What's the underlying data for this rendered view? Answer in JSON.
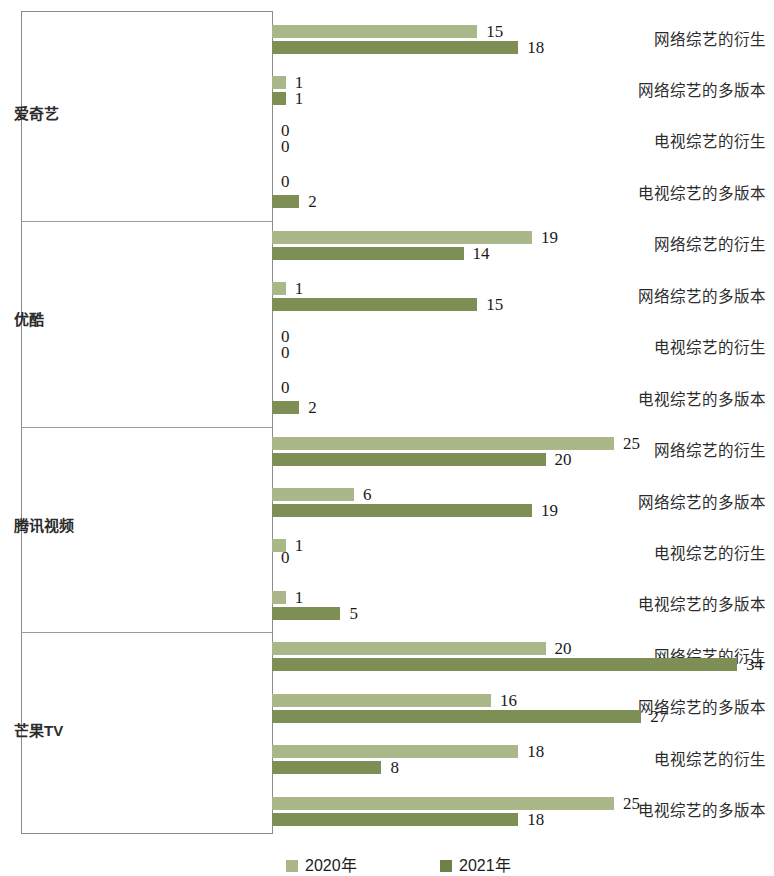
{
  "chart_data": {
    "type": "bar",
    "orientation": "horizontal",
    "title": "",
    "xlabel": "",
    "ylabel": "",
    "xlim": [
      0,
      34
    ],
    "grid": false,
    "legend_position": "bottom",
    "series": [
      {
        "name": "2020年",
        "color": "#a9b789"
      },
      {
        "name": "2021年",
        "color": "#7d8f54"
      }
    ],
    "groups": [
      {
        "name": "爱奇艺",
        "categories": [
          "网络综艺的衍生",
          "网络综艺的多版本",
          "电视综艺的衍生",
          "电视综艺的多版本"
        ],
        "values_2020": [
          15,
          1,
          0,
          0
        ],
        "values_2021": [
          18,
          1,
          0,
          2
        ]
      },
      {
        "name": "优酷",
        "categories": [
          "网络综艺的衍生",
          "网络综艺的多版本",
          "电视综艺的衍生",
          "电视综艺的多版本"
        ],
        "values_2020": [
          19,
          1,
          0,
          0
        ],
        "values_2021": [
          14,
          15,
          0,
          2
        ]
      },
      {
        "name": "腾讯视频",
        "categories": [
          "网络综艺的衍生",
          "网络综艺的多版本",
          "电视综艺的衍生",
          "电视综艺的多版本"
        ],
        "values_2020": [
          25,
          6,
          1,
          1
        ],
        "values_2021": [
          20,
          19,
          0,
          5
        ]
      },
      {
        "name": "芒果TV",
        "categories": [
          "网络综艺的衍生",
          "网络综艺的多版本",
          "电视综艺的衍生",
          "电视综艺的多版本"
        ],
        "values_2020": [
          20,
          16,
          18,
          25
        ],
        "values_2021": [
          34,
          27,
          8,
          18
        ]
      }
    ]
  },
  "legend": {
    "items": [
      {
        "label": "2020年",
        "color": "#a9b789"
      },
      {
        "label": "2021年",
        "color": "#6f8246"
      }
    ]
  },
  "colors": {
    "series_2020": "#a9b789",
    "series_2021": "#7d8f54",
    "axis": "#8a8a8a",
    "text": "#1a1a1a",
    "background": "#ffffff"
  }
}
